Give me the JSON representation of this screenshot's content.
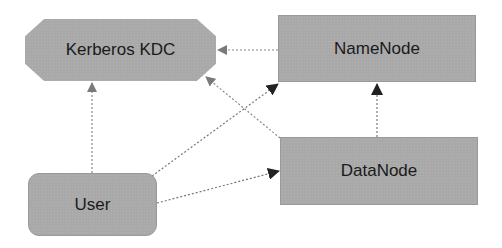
{
  "diagram": {
    "nodes": {
      "kdc": {
        "label": "Kerberos KDC",
        "shape": "octagon"
      },
      "namenode": {
        "label": "NameNode",
        "shape": "rectangle"
      },
      "datanode": {
        "label": "DataNode",
        "shape": "rectangle"
      },
      "user": {
        "label": "User",
        "shape": "rounded-rectangle"
      }
    },
    "edges": [
      {
        "from": "NameNode",
        "to": "Kerberos KDC",
        "style": "dotted"
      },
      {
        "from": "DataNode",
        "to": "Kerberos KDC",
        "style": "dotted"
      },
      {
        "from": "User",
        "to": "Kerberos KDC",
        "style": "dotted"
      },
      {
        "from": "User",
        "to": "NameNode",
        "style": "dotted"
      },
      {
        "from": "User",
        "to": "DataNode",
        "style": "dotted"
      },
      {
        "from": "DataNode",
        "to": "NameNode",
        "style": "dotted"
      }
    ],
    "colors": {
      "node_fill": "#a9a9a9",
      "edge": "#8a8a8a",
      "arrow_dark": "#222222",
      "arrow_light": "#777777"
    }
  }
}
